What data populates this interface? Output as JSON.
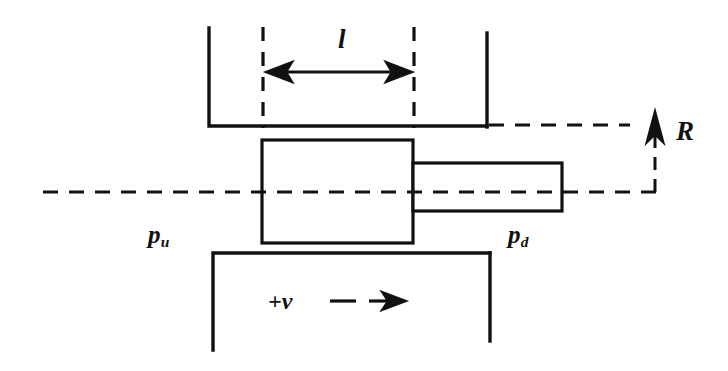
{
  "figure": {
    "background_color": "#ffffff",
    "stroke_color": "#111111",
    "width": 728,
    "height": 371
  },
  "labels": {
    "length": {
      "symbol": "l",
      "meaning": "valve opening length",
      "x": 345,
      "y": 45
    },
    "reaction": {
      "symbol": "R",
      "meaning": "reaction force",
      "x": 683,
      "y": 133
    },
    "pressure_upstream": {
      "symbol": "p",
      "subscript": "u",
      "meaning": "upstream pressure",
      "x": 158,
      "y": 236
    },
    "pressure_downstream": {
      "symbol": "p",
      "subscript": "d",
      "meaning": "downstream pressure",
      "x": 518,
      "y": 236
    },
    "velocity": {
      "symbol": "+v",
      "meaning": "positive spool velocity direction",
      "x": 275,
      "y": 303
    }
  },
  "geometry": {
    "centerline": {
      "name": "axis-centerline",
      "x1": 43,
      "x2": 660,
      "y": 192,
      "style": "dashed"
    },
    "upper_reference_line": {
      "name": "upper-dashed-reference",
      "x1": 490,
      "x2": 628,
      "y": 125,
      "style": "dashed"
    },
    "wall_upper_left": {
      "name": "upper-left-chamber-wall",
      "vertical_x": 209,
      "vertical_y1": 28,
      "vertical_y2": 126,
      "horizontal_x2": 487
    },
    "wall_upper_right": {
      "name": "upper-right-chamber-wall",
      "x": 487,
      "y1": 33,
      "y2": 126
    },
    "wall_lower_left": {
      "name": "lower-left-chamber-wall",
      "vertical_x": 213,
      "vertical_y1": 253,
      "vertical_y2": 350,
      "horizontal_x2": 490
    },
    "wall_lower_right": {
      "name": "lower-right-chamber-wall",
      "x": 490,
      "y1": 253,
      "y2": 341
    },
    "spool_body": {
      "name": "spool-land-rectangle",
      "x": 262,
      "y": 140,
      "width": 151,
      "height": 103
    },
    "spool_stem": {
      "name": "spool-stem-rectangle",
      "x": 413,
      "y": 163,
      "width": 149,
      "height": 48
    },
    "extension_line_left": {
      "name": "dimension-extension-left",
      "x": 263,
      "y1": 27,
      "y2": 127,
      "style": "dashed"
    },
    "extension_line_right": {
      "name": "dimension-extension-right",
      "x": 414,
      "y1": 27,
      "y2": 127,
      "style": "dashed"
    },
    "dimension_arrow": {
      "name": "length-dimension-arrow",
      "x1": 266,
      "x2": 411,
      "y": 72,
      "arrowheads": "both"
    },
    "reaction_arrow": {
      "name": "reaction-force-arrow",
      "x": 655,
      "y1": 192,
      "y2": 118,
      "direction": "up",
      "style": "dashed"
    },
    "velocity_arrow": {
      "name": "velocity-direction-arrow",
      "x1": 330,
      "x2": 404,
      "y": 301,
      "direction": "right",
      "style": "dashed"
    }
  }
}
